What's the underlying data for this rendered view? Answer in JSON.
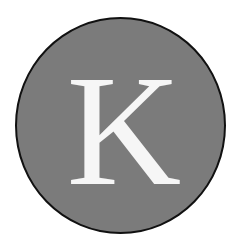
{
  "badge": {
    "letter": "K",
    "fill_color": "#7b7b7b",
    "outline_color": "#111111",
    "letter_color": "#f6f6f6"
  }
}
